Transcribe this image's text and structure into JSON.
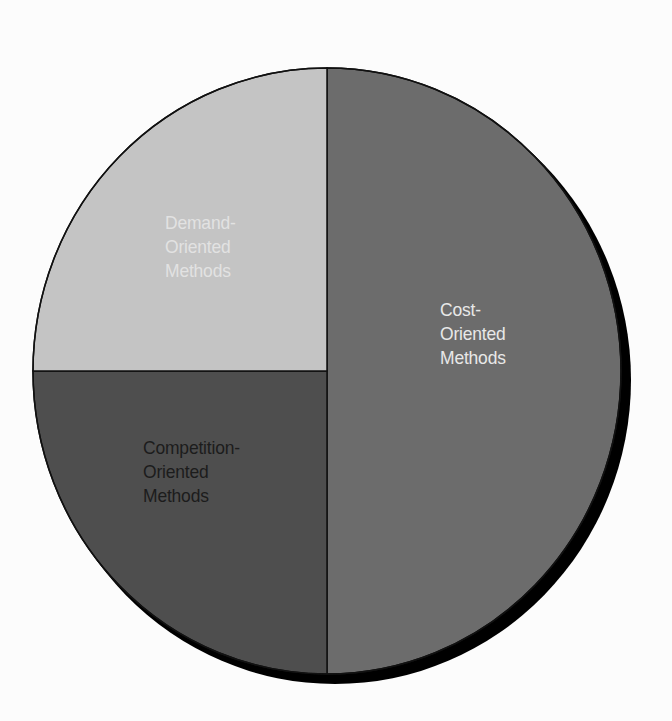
{
  "chart_data": {
    "type": "pie",
    "title": "",
    "slices": [
      {
        "label": "Cost-Oriented Methods",
        "lines": [
          "Cost-",
          "Oriented",
          "Methods"
        ],
        "value": 50,
        "color": "#6c6c6c",
        "text_color": "#e8e8e8"
      },
      {
        "label": "Demand-Oriented Methods",
        "lines": [
          "Demand-",
          "Oriented",
          "Methods"
        ],
        "value": 25,
        "color": "#4e4e4e",
        "text_color": "#e2e2e2"
      },
      {
        "label": "Competition-Oriented Methods",
        "lines": [
          "Competition-",
          "Oriented",
          "Methods"
        ],
        "value": 25,
        "color": "#c4c4c4",
        "text_color": "#1c1c1c"
      }
    ],
    "start_angle_deg": -90,
    "direction": "clockwise",
    "legend": "none",
    "labels_inside": true,
    "shadow": true
  },
  "colors": {
    "background": "#fcfcfc",
    "outline": "#111111",
    "shadow": "#000000"
  }
}
